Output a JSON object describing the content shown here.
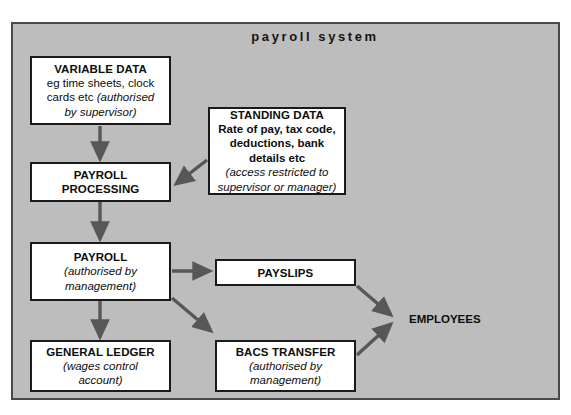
{
  "diagram": {
    "title": "payroll system",
    "frame_color": "#bdbdbd",
    "border_color": "#4a4a4a",
    "arrow_color": "#575757",
    "box_fill": "#ffffff",
    "box_border": "#1a1a1a",
    "text_color": "#0d0d0d"
  },
  "nodes": [
    {
      "id": "variable-data",
      "title": "VARIABLE DATA",
      "line1": "eg time sheets, clock",
      "line2_plain": "cards etc ",
      "line2_italic": "(authorised",
      "line3_italic": "by supervisor)"
    },
    {
      "id": "standing-data",
      "title": "STANDING DATA",
      "line1": "Rate of pay, tax code,",
      "line2": "deductions, bank",
      "line3": "details etc",
      "note1": "(access restricted to",
      "note2": "supervisor or manager)"
    },
    {
      "id": "payroll-processing",
      "title1": "PAYROLL",
      "title2": "PROCESSING"
    },
    {
      "id": "payroll",
      "title": "PAYROLL",
      "note1": "(authorised by",
      "note2": "management)"
    },
    {
      "id": "payslips",
      "title": "PAYSLIPS"
    },
    {
      "id": "general-ledger",
      "title": "GENERAL LEDGER",
      "note1": "(wages control",
      "note2": "account)"
    },
    {
      "id": "bacs-transfer",
      "title": "BACS TRANSFER",
      "note1": "(authorised by",
      "note2": "management)"
    },
    {
      "id": "employees",
      "title": "EMPLOYEES"
    }
  ],
  "flows": [
    {
      "from": "variable-data",
      "to": "payroll-processing",
      "style": "vertical"
    },
    {
      "from": "standing-data",
      "to": "payroll-processing",
      "style": "diagonal"
    },
    {
      "from": "payroll-processing",
      "to": "payroll",
      "style": "vertical"
    },
    {
      "from": "payroll",
      "to": "payslips",
      "style": "horizontal"
    },
    {
      "from": "payroll",
      "to": "general-ledger",
      "style": "vertical"
    },
    {
      "from": "payroll",
      "to": "bacs-transfer",
      "style": "diagonal"
    },
    {
      "from": "payslips",
      "to": "employees",
      "style": "diagonal"
    },
    {
      "from": "bacs-transfer",
      "to": "employees",
      "style": "diagonal"
    }
  ]
}
